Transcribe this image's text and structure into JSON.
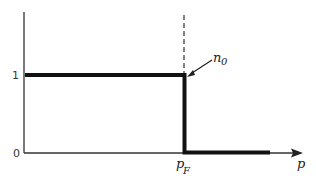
{
  "diagram": {
    "type": "step-function",
    "y_ticks": [
      {
        "label": "1",
        "value": 1
      },
      {
        "label": "0",
        "value": 0
      }
    ],
    "x_axis": {
      "label": "p"
    },
    "x_marks": [
      {
        "label": "p",
        "subscript": "F"
      }
    ],
    "curve_label": {
      "text": "n",
      "subscript": "0"
    },
    "colors": {
      "line": "#111111",
      "axis": "#333333",
      "background": "#ffffff"
    }
  }
}
